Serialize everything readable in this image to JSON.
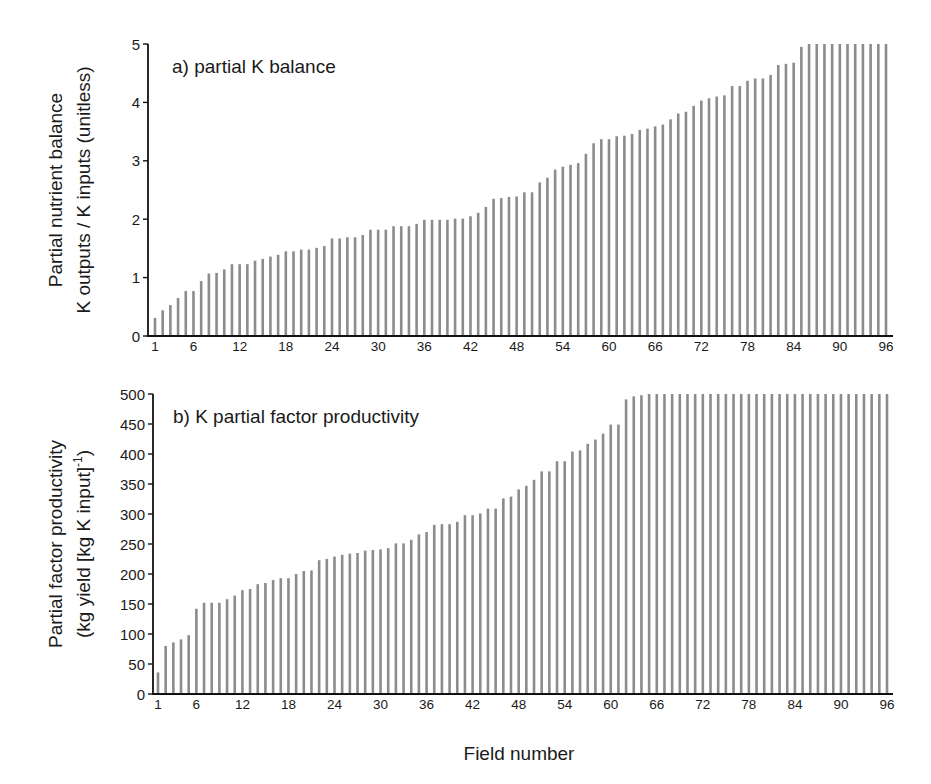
{
  "figure": {
    "xlabel": "Field number",
    "bar_color": "#8c8c8c",
    "axis_color": "#111111"
  },
  "chart_data": [
    {
      "type": "bar",
      "title": "a) partial K balance",
      "ylabel_line1": "Partial nutrient balance",
      "ylabel_line2": "K outputs / K inputs (unitless)",
      "xlabel": "",
      "ylim": [
        0,
        5
      ],
      "yticks": [
        0,
        1,
        2,
        3,
        4,
        5
      ],
      "xtick_labels": [
        1,
        6,
        12,
        18,
        24,
        30,
        36,
        42,
        48,
        54,
        60,
        66,
        72,
        78,
        84,
        90,
        96
      ],
      "x": [
        1,
        2,
        3,
        4,
        5,
        6,
        7,
        8,
        9,
        10,
        11,
        12,
        13,
        14,
        15,
        16,
        17,
        18,
        19,
        20,
        21,
        22,
        23,
        24,
        25,
        26,
        27,
        28,
        29,
        30,
        31,
        32,
        33,
        34,
        35,
        36,
        37,
        38,
        39,
        40,
        41,
        42,
        43,
        44,
        45,
        46,
        47,
        48,
        49,
        50,
        51,
        52,
        53,
        54,
        55,
        56,
        57,
        58,
        59,
        60,
        61,
        62,
        63,
        64,
        65,
        66,
        67,
        68,
        69,
        70,
        71,
        72,
        73,
        74,
        75,
        76,
        77,
        78,
        79,
        80,
        81,
        82,
        83,
        84,
        85,
        86,
        87,
        88,
        89,
        90,
        91,
        92,
        93,
        94,
        95,
        96
      ],
      "values": [
        0.31,
        0.44,
        0.53,
        0.65,
        0.77,
        0.77,
        0.94,
        1.07,
        1.08,
        1.14,
        1.23,
        1.23,
        1.23,
        1.29,
        1.32,
        1.36,
        1.39,
        1.45,
        1.45,
        1.48,
        1.48,
        1.51,
        1.54,
        1.67,
        1.67,
        1.69,
        1.69,
        1.73,
        1.82,
        1.82,
        1.82,
        1.88,
        1.88,
        1.88,
        1.92,
        1.99,
        1.99,
        1.99,
        1.99,
        2.01,
        2.01,
        2.05,
        2.11,
        2.21,
        2.35,
        2.36,
        2.38,
        2.39,
        2.46,
        2.46,
        2.63,
        2.71,
        2.85,
        2.9,
        2.93,
        2.96,
        3.12,
        3.3,
        3.37,
        3.37,
        3.42,
        3.43,
        3.46,
        3.53,
        3.55,
        3.59,
        3.62,
        3.71,
        3.81,
        3.84,
        3.94,
        4.03,
        4.07,
        4.1,
        4.12,
        4.28,
        4.28,
        4.37,
        4.41,
        4.41,
        4.47,
        4.64,
        4.66,
        4.68,
        4.95,
        5,
        5,
        5,
        5,
        5,
        5,
        5,
        5,
        5,
        5,
        5
      ]
    },
    {
      "type": "bar",
      "title": "b) K partial factor productivity",
      "ylabel_line1": "Partial factor productivity",
      "ylabel_line2": "(kg yield [kg K input]",
      "ylabel_sup": "-1",
      "ylabel_close": ")",
      "xlabel": "Field number",
      "ylim": [
        0,
        500
      ],
      "yticks": [
        0,
        50,
        100,
        150,
        200,
        250,
        300,
        350,
        400,
        450,
        500
      ],
      "xtick_labels": [
        1,
        6,
        12,
        18,
        24,
        30,
        36,
        42,
        48,
        54,
        60,
        66,
        72,
        78,
        84,
        90,
        96
      ],
      "x": [
        1,
        2,
        3,
        4,
        5,
        6,
        7,
        8,
        9,
        10,
        11,
        12,
        13,
        14,
        15,
        16,
        17,
        18,
        19,
        20,
        21,
        22,
        23,
        24,
        25,
        26,
        27,
        28,
        29,
        30,
        31,
        32,
        33,
        34,
        35,
        36,
        37,
        38,
        39,
        40,
        41,
        42,
        43,
        44,
        45,
        46,
        47,
        48,
        49,
        50,
        51,
        52,
        53,
        54,
        55,
        56,
        57,
        58,
        59,
        60,
        61,
        62,
        63,
        64,
        65,
        66,
        67,
        68,
        69,
        70,
        71,
        72,
        73,
        74,
        75,
        76,
        77,
        78,
        79,
        80,
        81,
        82,
        83,
        84,
        85,
        86,
        87,
        88,
        89,
        90,
        91,
        92,
        93,
        94,
        95,
        96
      ],
      "values": [
        36,
        80,
        86,
        91,
        98,
        142,
        152,
        152,
        152,
        158,
        164,
        173,
        175,
        183,
        185,
        190,
        193,
        193,
        200,
        205,
        206,
        223,
        225,
        229,
        232,
        234,
        235,
        239,
        240,
        241,
        243,
        251,
        251,
        257,
        266,
        270,
        282,
        283,
        283,
        287,
        298,
        298,
        301,
        309,
        309,
        326,
        329,
        341,
        347,
        357,
        371,
        371,
        388,
        388,
        404,
        406,
        417,
        424,
        434,
        449,
        449,
        491,
        496,
        498,
        500,
        500,
        500,
        500,
        500,
        500,
        500,
        500,
        500,
        500,
        500,
        500,
        500,
        500,
        500,
        500,
        500,
        500,
        500,
        500,
        500,
        500,
        500,
        500,
        500,
        500,
        500,
        500,
        500,
        500,
        500,
        500
      ]
    }
  ]
}
